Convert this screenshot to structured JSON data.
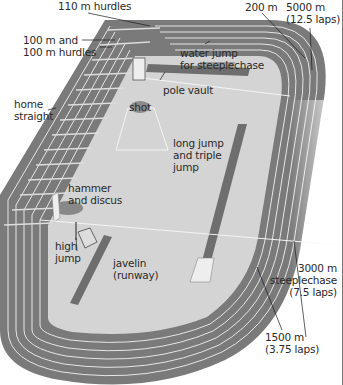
{
  "diagram": {
    "colors": {
      "track": "#7a7a7a",
      "track_dark": "#666666",
      "lane_lines": "#e8e8e8",
      "infield": "#d2d2d2",
      "runways": "#6e6e6e",
      "text": "#2a2a2a",
      "leader_lines": "#1a1a1a"
    },
    "labels": {
      "hurdles_110": "110 m hurdles",
      "hurdles_100": "100 m and\n100 m hurdles",
      "home_straight": "home\nstraight",
      "shot": "shot",
      "pole_vault": "pole vault",
      "water_jump": "water jump\nfor steeplechase",
      "m200": "200 m",
      "m5000": "5000 m\n(12.5 laps)",
      "long_jump": "long jump\nand triple\njump",
      "hammer_discus": "hammer\nand discus",
      "high_jump": "high\njump",
      "javelin": "javelin\n(runway)",
      "steeplechase_3000": "3000 m\nsteeplechase\n(7.5 laps)",
      "m1500": "1500 m\n(3.75 laps)"
    }
  }
}
